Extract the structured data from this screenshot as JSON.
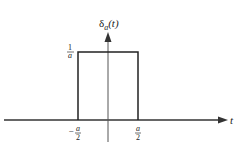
{
  "diagram": {
    "y_axis_label": "δ",
    "y_axis_sub": "a",
    "y_axis_arg": "(t)",
    "x_axis_label": "t",
    "height_label": {
      "num": "1",
      "den": "a"
    },
    "left_tick": {
      "sign": "−",
      "num": "a",
      "den": "2"
    },
    "right_tick": {
      "num": "a",
      "den": "2"
    }
  }
}
